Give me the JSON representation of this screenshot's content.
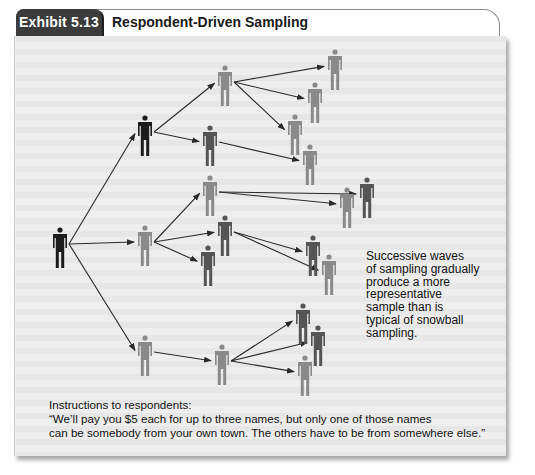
{
  "exhibit": {
    "label": "Exhibit 5.13",
    "title": "Respondent-Driven Sampling"
  },
  "colors": {
    "tab_bg": "#3b3b3b",
    "panel_bg": "#eeeeee",
    "person_black": "#1c1c1c",
    "person_dark": "#555555",
    "person_grey": "#8a8a8a",
    "arrow": "#2a2a2a"
  },
  "note": {
    "lines": [
      "Successive waves",
      "of sampling gradually",
      "produce a more",
      "representative",
      "sample than is",
      "typical of snowball",
      "sampling."
    ]
  },
  "instructions": {
    "heading": "Instructions to respondents:",
    "line1": "“We’ll pay you $5 each for up to three names, but only one of those names",
    "line2": "can be somebody from your own town. The others have to be from somewhere else.”"
  },
  "diagram": {
    "people": [
      {
        "id": "root",
        "x": 60,
        "y": 230,
        "tone": "black",
        "wave": 0
      },
      {
        "id": "w1a",
        "x": 145,
        "y": 118,
        "tone": "black",
        "wave": 1
      },
      {
        "id": "w1b",
        "x": 145,
        "y": 228,
        "tone": "grey",
        "wave": 1
      },
      {
        "id": "w1c",
        "x": 145,
        "y": 338,
        "tone": "grey",
        "wave": 1
      },
      {
        "id": "w2a",
        "x": 225,
        "y": 68,
        "tone": "grey",
        "wave": 2
      },
      {
        "id": "w2b",
        "x": 210,
        "y": 128,
        "tone": "dark",
        "wave": 2
      },
      {
        "id": "w2c",
        "x": 210,
        "y": 178,
        "tone": "grey",
        "wave": 2
      },
      {
        "id": "w2d",
        "x": 225,
        "y": 218,
        "tone": "dark",
        "wave": 2
      },
      {
        "id": "w2e",
        "x": 208,
        "y": 248,
        "tone": "dark",
        "wave": 2
      },
      {
        "id": "w2f",
        "x": 222,
        "y": 347,
        "tone": "grey",
        "wave": 2
      },
      {
        "id": "w3a",
        "x": 335,
        "y": 52,
        "tone": "grey",
        "wave": 3
      },
      {
        "id": "w3b",
        "x": 315,
        "y": 85,
        "tone": "grey",
        "wave": 3
      },
      {
        "id": "w3c",
        "x": 295,
        "y": 117,
        "tone": "grey",
        "wave": 3
      },
      {
        "id": "w3d",
        "x": 310,
        "y": 147,
        "tone": "grey",
        "wave": 3
      },
      {
        "id": "w3e",
        "x": 367,
        "y": 180,
        "tone": "dark",
        "wave": 3
      },
      {
        "id": "w3f",
        "x": 347,
        "y": 190,
        "tone": "grey",
        "wave": 3
      },
      {
        "id": "w3g",
        "x": 313,
        "y": 238,
        "tone": "dark",
        "wave": 3
      },
      {
        "id": "w3h",
        "x": 329,
        "y": 257,
        "tone": "grey",
        "wave": 3
      },
      {
        "id": "w3i",
        "x": 303,
        "y": 306,
        "tone": "dark",
        "wave": 3
      },
      {
        "id": "w3j",
        "x": 318,
        "y": 328,
        "tone": "dark",
        "wave": 3
      },
      {
        "id": "w3k",
        "x": 305,
        "y": 358,
        "tone": "grey",
        "wave": 3
      }
    ],
    "links": [
      [
        "root",
        "w1a"
      ],
      [
        "root",
        "w1b"
      ],
      [
        "root",
        "w1c"
      ],
      [
        "w1a",
        "w2a"
      ],
      [
        "w1a",
        "w2b"
      ],
      [
        "w1b",
        "w2c"
      ],
      [
        "w1b",
        "w2d"
      ],
      [
        "w1b",
        "w2e"
      ],
      [
        "w1c",
        "w2f"
      ],
      [
        "w2a",
        "w3a"
      ],
      [
        "w2a",
        "w3b"
      ],
      [
        "w2a",
        "w3c"
      ],
      [
        "w2b",
        "w3d"
      ],
      [
        "w2c",
        "w3e"
      ],
      [
        "w2c",
        "w3f"
      ],
      [
        "w2d",
        "w3g"
      ],
      [
        "w2d",
        "w3h"
      ],
      [
        "w2f",
        "w3i"
      ],
      [
        "w2f",
        "w3j"
      ],
      [
        "w2f",
        "w3k"
      ]
    ]
  }
}
